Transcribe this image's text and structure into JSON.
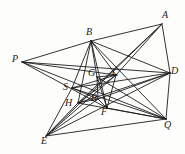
{
  "figure": {
    "width": 185,
    "height": 154,
    "background_color": "#fdfdfc",
    "stroke_color": "#1d1d1d",
    "label_color": "#1a1a1a"
  },
  "points": {
    "P": {
      "label": "P",
      "x": 22,
      "y": 62,
      "label_x": 12,
      "label_y": 54
    },
    "A": {
      "label": "A",
      "x": 162,
      "y": 24,
      "label_x": 162,
      "label_y": 10
    },
    "B": {
      "label": "B",
      "x": 91,
      "y": 41,
      "label_x": 86,
      "label_y": 27
    },
    "D": {
      "label": "D",
      "x": 170,
      "y": 73,
      "label_x": 171,
      "label_y": 66
    },
    "Q": {
      "label": "Q",
      "x": 166,
      "y": 119,
      "label_x": 164,
      "label_y": 120
    },
    "E": {
      "label": "E",
      "x": 46,
      "y": 136,
      "label_x": 41,
      "label_y": 136
    },
    "G": {
      "label": "G",
      "x": 97,
      "y": 77,
      "label_x": 88,
      "label_y": 68
    },
    "C": {
      "label": "C",
      "x": 116,
      "y": 75,
      "label_x": 112,
      "label_y": 68
    },
    "S": {
      "label": "S",
      "x": 72,
      "y": 88,
      "label_x": 63,
      "label_y": 82
    },
    "H": {
      "label": "H",
      "x": 78,
      "y": 103,
      "label_x": 65,
      "label_y": 98
    },
    "R": {
      "label": "R",
      "x": 98,
      "y": 99,
      "label_x": 91,
      "label_y": 93
    },
    "F": {
      "label": "F",
      "x": 107,
      "y": 108,
      "label_x": 101,
      "label_y": 107
    }
  },
  "segments": [
    {
      "name": "P-B",
      "from": "P",
      "to": "B"
    },
    {
      "name": "P-D",
      "from": "P",
      "to": "D"
    },
    {
      "name": "P-C",
      "from": "P",
      "to": "C"
    },
    {
      "name": "P-F",
      "from": "P",
      "to": "F"
    },
    {
      "name": "P-Q",
      "from": "P",
      "to": "Q"
    },
    {
      "name": "B-A",
      "from": "B",
      "to": "A"
    },
    {
      "name": "B-D",
      "from": "B",
      "to": "D"
    },
    {
      "name": "B-C",
      "from": "B",
      "to": "C"
    },
    {
      "name": "B-G",
      "from": "B",
      "to": "G"
    },
    {
      "name": "B-S",
      "from": "B",
      "to": "S"
    },
    {
      "name": "B-H",
      "from": "B",
      "to": "H"
    },
    {
      "name": "B-F",
      "from": "B",
      "to": "F"
    },
    {
      "name": "B-Q",
      "from": "B",
      "to": "Q"
    },
    {
      "name": "A-D",
      "from": "A",
      "to": "D"
    },
    {
      "name": "A-C",
      "from": "A",
      "to": "C"
    },
    {
      "name": "A-H",
      "from": "A",
      "to": "H"
    },
    {
      "name": "A-E",
      "from": "A",
      "to": "E"
    },
    {
      "name": "D-Q",
      "from": "D",
      "to": "Q"
    },
    {
      "name": "D-S",
      "from": "D",
      "to": "S"
    },
    {
      "name": "D-H",
      "from": "D",
      "to": "H"
    },
    {
      "name": "D-R",
      "from": "D",
      "to": "R"
    },
    {
      "name": "D-E",
      "from": "D",
      "to": "E"
    },
    {
      "name": "Q-G",
      "from": "Q",
      "to": "G"
    },
    {
      "name": "Q-S",
      "from": "Q",
      "to": "S"
    },
    {
      "name": "Q-H",
      "from": "Q",
      "to": "H"
    },
    {
      "name": "Q-E",
      "from": "Q",
      "to": "E"
    },
    {
      "name": "E-S",
      "from": "E",
      "to": "S"
    },
    {
      "name": "E-H",
      "from": "E",
      "to": "H"
    },
    {
      "name": "E-R",
      "from": "E",
      "to": "R"
    },
    {
      "name": "E-C",
      "from": "E",
      "to": "C"
    },
    {
      "name": "G-F",
      "from": "G",
      "to": "F"
    },
    {
      "name": "C-F",
      "from": "C",
      "to": "F"
    },
    {
      "name": "G-R",
      "from": "G",
      "to": "R"
    },
    {
      "name": "S-R",
      "from": "S",
      "to": "R"
    },
    {
      "name": "H-R",
      "from": "H",
      "to": "R"
    },
    {
      "name": "H-C",
      "from": "H",
      "to": "C"
    },
    {
      "name": "S-C",
      "from": "S",
      "to": "C"
    },
    {
      "name": "R-F",
      "from": "R",
      "to": "F"
    },
    {
      "name": "F-Q",
      "from": "F",
      "to": "Q"
    },
    {
      "name": "G-C",
      "from": "G",
      "to": "C"
    }
  ]
}
